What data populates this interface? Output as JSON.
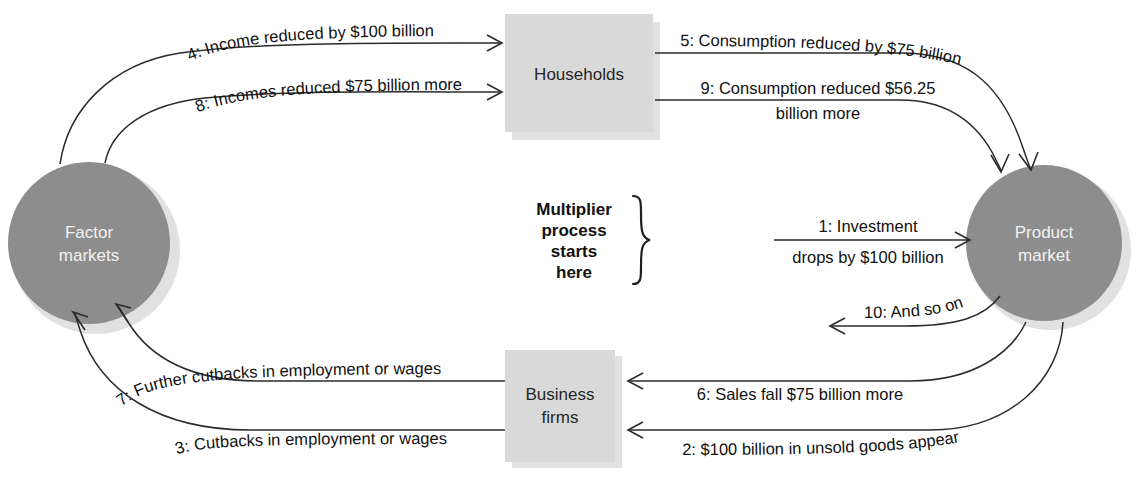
{
  "diagram": {
    "colors": {
      "circle_fill": "#8d8d8d",
      "box_fill": "#d9d9d9",
      "line": "#2b2b2b",
      "circle_text": "#f2f2f2",
      "box_text": "#262626",
      "background": "#ffffff"
    },
    "nodes": {
      "factor_markets": {
        "label_line1": "Factor",
        "label_line2": "markets",
        "shape": "circle"
      },
      "product_market": {
        "label_line1": "Product",
        "label_line2": "market",
        "shape": "circle"
      },
      "households": {
        "label_line1": "Households",
        "shape": "rectangle"
      },
      "business_firms": {
        "label_line1": "Business",
        "label_line2": "firms",
        "shape": "rectangle"
      }
    },
    "callout": {
      "line1": "Multiplier",
      "line2": "process",
      "line3": "starts",
      "line4": "here",
      "brace": "right-curly-brace"
    },
    "edges": [
      {
        "step": "1",
        "label_line1": "1: Investment",
        "label_line2": "drops by $100 billion",
        "from": "multiplier-start",
        "to": "product_market"
      },
      {
        "step": "2",
        "label_line1": "2: $100 billion in unsold goods appear",
        "from": "product_market",
        "to": "business_firms"
      },
      {
        "step": "3",
        "label_line1": "3: Cutbacks in employment or wages",
        "from": "business_firms",
        "to": "factor_markets"
      },
      {
        "step": "4",
        "label_line1": "4: Income reduced by $100 billion",
        "from": "factor_markets",
        "to": "households"
      },
      {
        "step": "5",
        "label_line1": "5: Consumption reduced by $75 billion",
        "from": "households",
        "to": "product_market"
      },
      {
        "step": "6",
        "label_line1": "6: Sales fall $75 billion more",
        "from": "product_market",
        "to": "business_firms"
      },
      {
        "step": "7",
        "label_line1": "7: Further cutbacks in employment or wages",
        "from": "business_firms",
        "to": "factor_markets"
      },
      {
        "step": "8",
        "label_line1": "8: Incomes reduced $75 billion more",
        "from": "factor_markets",
        "to": "households"
      },
      {
        "step": "9",
        "label_line1": "9: Consumption reduced $56.25",
        "label_line2": "billion more",
        "from": "households",
        "to": "product_market"
      },
      {
        "step": "10",
        "label_line1": "10: And so on",
        "from": "product_market",
        "to": "left"
      }
    ]
  }
}
